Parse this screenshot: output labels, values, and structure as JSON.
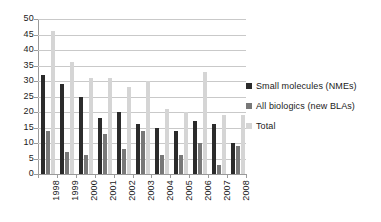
{
  "chart_data": {
    "type": "bar",
    "title": "",
    "subtitle": "",
    "xlabel": "",
    "ylabel": "",
    "ylim": [
      0,
      50
    ],
    "ytick_step": 5,
    "yticks": [
      0,
      5,
      10,
      15,
      20,
      25,
      30,
      35,
      40,
      45,
      50
    ],
    "grid": true,
    "legend_position": "right",
    "categories": [
      "1998",
      "1999",
      "2000",
      "2001",
      "2002",
      "2003",
      "2004",
      "2005",
      "2006",
      "2007",
      "2008"
    ],
    "series": [
      {
        "name": "Small molecules (NMEs)",
        "color": "#2b2b2b",
        "values": [
          32,
          29,
          25,
          18,
          20,
          16,
          15,
          14,
          17,
          16,
          10
        ]
      },
      {
        "name": "All biologics (new BLAs)",
        "color": "#787878",
        "values": [
          14,
          7,
          6,
          13,
          8,
          14,
          6,
          6,
          10,
          3,
          9
        ]
      },
      {
        "name": "Total",
        "color": "#d5d5d5",
        "values": [
          46,
          36,
          31,
          31,
          28,
          30,
          21,
          20,
          33,
          19,
          19
        ]
      }
    ]
  },
  "legend": {
    "items": [
      {
        "label": "Small molecules (NMEs)",
        "color": "#2b2b2b"
      },
      {
        "label": "All biologics (new BLAs)",
        "color": "#787878"
      },
      {
        "label": "Total",
        "color": "#d5d5d5"
      }
    ]
  },
  "colors": {
    "small_molecules": "#2b2b2b",
    "biologics": "#787878",
    "total": "#d5d5d5",
    "gridline": "#c9c9c9",
    "axis": "#9a9a9a",
    "text": "#1a1a1a",
    "background": "#ffffff"
  }
}
